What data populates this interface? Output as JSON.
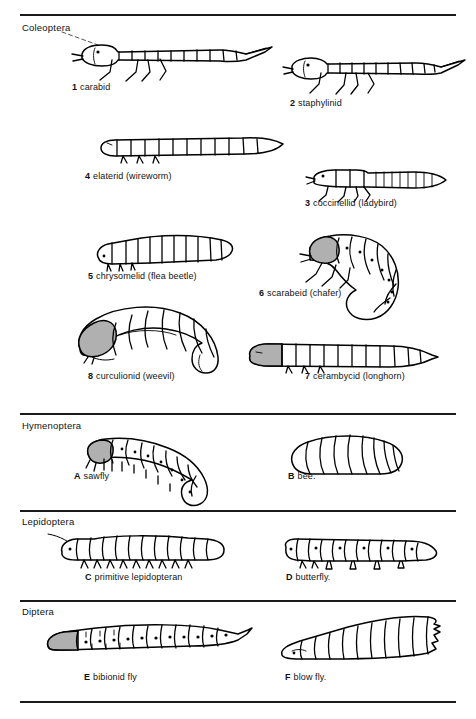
{
  "plate": {
    "background_color": "#ffffff",
    "ink_color": "#000000",
    "head_shade_color": "#b0b0b0",
    "width": 476,
    "height": 719
  },
  "sections": [
    {
      "id": "coleoptera",
      "order_name": "Coleoptera",
      "figures": [
        {
          "key": "1",
          "name": "carabid"
        },
        {
          "key": "2",
          "name": "staphylinid"
        },
        {
          "key": "4",
          "name": "elaterid (wireworm)"
        },
        {
          "key": "3",
          "name": "coccinellid (ladybird)"
        },
        {
          "key": "5",
          "name": "chrysomelid (flea beetle)"
        },
        {
          "key": "6",
          "name": "scarabeid (chafer)"
        },
        {
          "key": "8",
          "name": "curculionid (weevil)"
        },
        {
          "key": "7",
          "name": "cerambycid (longhorn)"
        }
      ]
    },
    {
      "id": "hymenoptera",
      "order_name": "Hymenoptera",
      "figures": [
        {
          "key": "A",
          "name": "sawfly"
        },
        {
          "key": "B",
          "name": "bee."
        }
      ]
    },
    {
      "id": "lepidoptera",
      "order_name": "Lepidoptera",
      "figures": [
        {
          "key": "C",
          "name": "primitive lepidopteran"
        },
        {
          "key": "D",
          "name": "butterfly."
        }
      ]
    },
    {
      "id": "diptera",
      "order_name": "Diptera",
      "figures": [
        {
          "key": "E",
          "name": "bibionid fly"
        },
        {
          "key": "F",
          "name": "blow fly."
        }
      ]
    }
  ]
}
